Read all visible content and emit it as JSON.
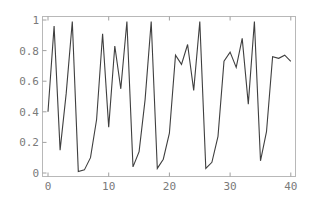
{
  "chart_data": {
    "type": "line",
    "title": "",
    "xlabel": "",
    "ylabel": "",
    "xlim": [
      0,
      40
    ],
    "ylim": [
      0,
      1
    ],
    "grid": false,
    "legend": null,
    "x_ticks": [
      0,
      10,
      20,
      30,
      40
    ],
    "y_ticks": [
      0,
      0.2,
      0.4,
      0.6,
      0.8,
      1
    ],
    "x_tick_labels": [
      "0",
      "10",
      "20",
      "30",
      "40"
    ],
    "y_tick_labels": [
      "0",
      "0.2",
      "0.4",
      "0.6",
      "0.8",
      "1"
    ],
    "series": [
      {
        "name": "sequence",
        "x": [
          0,
          1,
          2,
          3,
          4,
          5,
          6,
          7,
          8,
          9,
          10,
          11,
          12,
          13,
          14,
          15,
          16,
          17,
          18,
          19,
          20,
          21,
          22,
          23,
          24,
          25,
          26,
          27,
          28,
          29,
          30,
          31,
          32,
          33,
          34,
          35,
          36,
          37,
          38,
          39,
          40
        ],
        "values": [
          0.4,
          0.96,
          0.15,
          0.52,
          0.99,
          0.01,
          0.02,
          0.1,
          0.35,
          0.91,
          0.3,
          0.83,
          0.55,
          0.99,
          0.04,
          0.14,
          0.48,
          0.99,
          0.03,
          0.09,
          0.26,
          0.77,
          0.71,
          0.84,
          0.54,
          0.99,
          0.03,
          0.07,
          0.24,
          0.73,
          0.79,
          0.69,
          0.88,
          0.45,
          0.99,
          0.08,
          0.27,
          0.76,
          0.75,
          0.77,
          0.73
        ]
      }
    ]
  }
}
